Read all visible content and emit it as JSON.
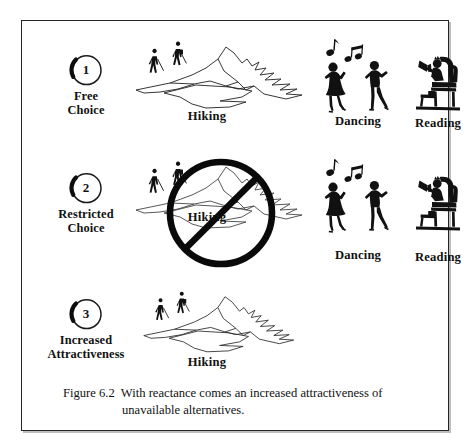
{
  "figure": {
    "caption_line_1": "Figure 6.2  With reactance comes an increased attractiveness of",
    "caption_line_2": "unavailable alternatives.",
    "caption_figure_number": "Figure 6.2",
    "caption_text": "With reactance comes an increased attractiveness of unavailable alternatives.",
    "frame_border_color": "#262626",
    "background_color": "#ffffff",
    "ink_color": "#111111"
  },
  "rows": [
    {
      "step_number": "1",
      "step_label_line_1": "Free",
      "step_label_line_2": "Choice",
      "activities": [
        {
          "name": "hiking",
          "caption": "Hiking",
          "available": true
        },
        {
          "name": "dancing",
          "caption": "Dancing",
          "available": true
        },
        {
          "name": "reading",
          "caption": "Reading",
          "available": true
        }
      ]
    },
    {
      "step_number": "2",
      "step_label_line_1": "Restricted",
      "step_label_line_2": "Choice",
      "activities": [
        {
          "name": "hiking",
          "caption": "Hiking",
          "available": false
        },
        {
          "name": "dancing",
          "caption": "Dancing",
          "available": true
        },
        {
          "name": "reading",
          "caption": "Reading",
          "available": true
        }
      ]
    },
    {
      "step_number": "3",
      "step_label_line_1": "Increased",
      "step_label_line_2": "Attractiveness",
      "activities": [
        {
          "name": "hiking",
          "caption": "Hiking",
          "available": true
        }
      ]
    }
  ],
  "icons": {
    "step_circle": "circle-number-badge-icon",
    "mountain": "mountain-icon",
    "hikers": "hikers-icon",
    "dancers": "dancing-couple-icon",
    "music_notes": "music-notes-icon",
    "reader": "person-reading-in-armchair-icon",
    "prohibition": "no-entry-slash-circle-icon"
  }
}
